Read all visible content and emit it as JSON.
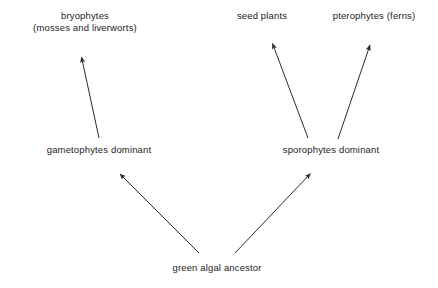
{
  "diagram": {
    "background_color": "#ffffff",
    "line_color": "#2b2b2b",
    "text_color": "#1d1d1d",
    "nodes": {
      "bryophytes": {
        "line1": "bryophytes",
        "line2": "(mosses and liverworts)"
      },
      "seed_plants": {
        "line1": "seed plants"
      },
      "pterophytes": {
        "line1": "pterophytes (ferns)"
      },
      "gametophytes": {
        "line1": "gametophytes dominant"
      },
      "sporophytes": {
        "line1": "sporophytes dominant"
      },
      "ancestor": {
        "line1": "green algal ancestor"
      }
    },
    "arrows": [
      {
        "name": "arrow-ancestor-to-gametophytes",
        "from": "green algal ancestor",
        "to": "gametophytes dominant"
      },
      {
        "name": "arrow-ancestor-to-sporophytes",
        "from": "green algal ancestor",
        "to": "sporophytes dominant"
      },
      {
        "name": "arrow-gametophytes-to-bryophytes",
        "from": "gametophytes dominant",
        "to": "bryophytes"
      },
      {
        "name": "arrow-sporophytes-to-seed-plants",
        "from": "sporophytes dominant",
        "to": "seed plants"
      },
      {
        "name": "arrow-sporophytes-to-pterophytes",
        "from": "sporophytes dominant",
        "to": "pterophytes (ferns)"
      }
    ]
  }
}
